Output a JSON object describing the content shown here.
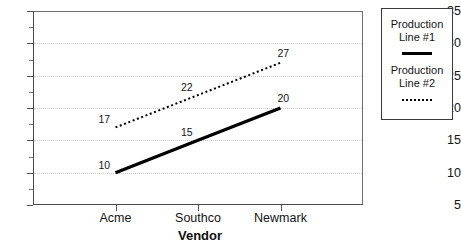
{
  "chart_data": {
    "type": "line",
    "title": "",
    "subtitle": "",
    "xlabel": "Vendor",
    "ylabel": "",
    "categories": [
      "Acme",
      "Southco",
      "Newmark"
    ],
    "series": [
      {
        "name": "Production Line #1",
        "style": "solid",
        "color": "#000000",
        "values": [
          10,
          15,
          20
        ],
        "point_labels": [
          "10",
          "15",
          "20"
        ]
      },
      {
        "name": "Production Line #2",
        "style": "dotted",
        "color": "#000000",
        "values": [
          17,
          22,
          27
        ],
        "point_labels": [
          "17",
          "22",
          "27"
        ]
      }
    ],
    "ylim": [
      5,
      35
    ],
    "ytick_labels": [
      "35",
      "30",
      "25",
      "20",
      "15",
      "10",
      "5"
    ],
    "ytick_values": [
      35,
      30,
      25,
      20,
      15,
      10,
      5
    ],
    "ytick_minor_values": [
      32.5,
      27.5,
      22.5,
      17.5,
      12.5,
      7.5
    ],
    "grid": true,
    "grid_color": "#c9c9c9",
    "legend_position": "right",
    "legend": [
      {
        "label_line1": "Production",
        "label_line2": "Line #1",
        "style": "solid"
      },
      {
        "label_line1": "Production",
        "label_line2": "Line #2",
        "style": "dotted"
      }
    ]
  }
}
